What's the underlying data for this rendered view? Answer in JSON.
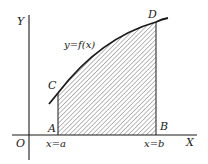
{
  "diagram": {
    "type": "area-under-curve",
    "colors": {
      "ink": "#1a1a1a",
      "hatch": "#555555",
      "background": "#ffffff"
    },
    "axes": {
      "y_label": "Y",
      "x_label": "X",
      "origin_label": "O"
    },
    "curve": {
      "label": "y=f(x)"
    },
    "points": {
      "A": "A",
      "B": "B",
      "C": "C",
      "D": "D"
    },
    "bounds": {
      "left": "x=a",
      "right": "x=b"
    }
  }
}
